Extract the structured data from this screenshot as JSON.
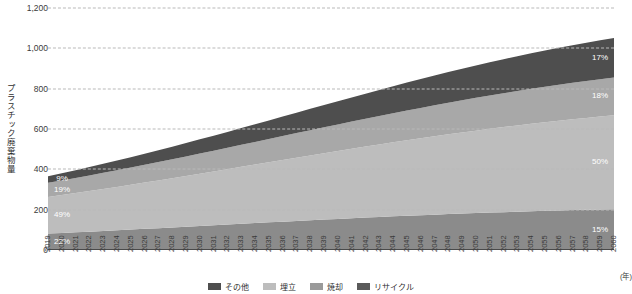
{
  "chart_data": {
    "type": "area",
    "stacked": true,
    "title": "",
    "xlabel": "(年)",
    "ylabel": "プラスチック廃棄物量",
    "ylim": [
      0,
      1200
    ],
    "yticks": [
      0,
      200,
      400,
      600,
      800,
      1000,
      1200
    ],
    "ytick_labels": [
      "0",
      "200",
      "400",
      "600",
      "800",
      "1,000",
      "1,200"
    ],
    "grid": true,
    "legend_position": "bottom",
    "x": [
      2019,
      2020,
      2021,
      2022,
      2023,
      2024,
      2025,
      2026,
      2027,
      2028,
      2029,
      2030,
      2031,
      2032,
      2033,
      2034,
      2035,
      2036,
      2037,
      2038,
      2039,
      2040,
      2041,
      2042,
      2043,
      2044,
      2045,
      2046,
      2047,
      2048,
      2049,
      2050,
      2051,
      2052,
      2053,
      2054,
      2055,
      2056,
      2057,
      2058,
      2059,
      2060
    ],
    "categories": [
      "2019",
      "2020",
      "2021",
      "2022",
      "2023",
      "2024",
      "2025",
      "2026",
      "2027",
      "2028",
      "2029",
      "2030",
      "2031",
      "2032",
      "2033",
      "2034",
      "2035",
      "2036",
      "2037",
      "2038",
      "2039",
      "2040",
      "2041",
      "2042",
      "2043",
      "2044",
      "2045",
      "2046",
      "2047",
      "2048",
      "2049",
      "2050",
      "2051",
      "2052",
      "2053",
      "2054",
      "2055",
      "2056",
      "2057",
      "2058",
      "2059",
      "2060"
    ],
    "series": [
      {
        "name": "リサイクル",
        "color": "#8b8b8b",
        "stack_order": 0,
        "values": [
          81.4,
          84.6,
          87.8,
          91.1,
          94.5,
          97.9,
          101.4,
          104.9,
          108.4,
          112.0,
          115.6,
          119.2,
          122.8,
          126.4,
          130.0,
          133.6,
          137.2,
          140.7,
          144.2,
          147.6,
          151.0,
          154.3,
          157.5,
          160.7,
          163.8,
          166.8,
          169.7,
          172.6,
          175.4,
          178.0,
          180.6,
          183.1,
          185.5,
          187.8,
          190.0,
          192.1,
          194.1,
          196.0,
          197.8,
          199.5,
          201.1,
          202.6
        ]
      },
      {
        "name": "焼却",
        "color": "#bdbdbd",
        "stack_order": 1,
        "values": [
          181.3,
          187.8,
          194.4,
          201.1,
          208.0,
          215.0,
          222.1,
          229.3,
          236.6,
          244.0,
          251.5,
          259.1,
          266.7,
          274.4,
          282.2,
          290.0,
          297.8,
          305.6,
          313.4,
          321.2,
          329.0,
          336.7,
          344.4,
          352.0,
          359.5,
          366.9,
          374.2,
          381.4,
          388.5,
          395.4,
          402.2,
          408.8,
          415.3,
          421.6,
          427.7,
          433.7,
          439.4,
          445.0,
          450.4,
          455.6,
          460.6,
          465.4
        ]
      },
      {
        "name": "埋立",
        "color": "#a8a8a8",
        "stack_order": 2,
        "values": [
          70.3,
          72.7,
          75.2,
          77.7,
          80.3,
          83.0,
          85.7,
          88.5,
          91.3,
          94.2,
          97.1,
          100.1,
          103.1,
          106.2,
          109.3,
          112.4,
          115.6,
          118.8,
          122.0,
          125.2,
          128.4,
          131.6,
          134.8,
          138.0,
          141.2,
          144.4,
          147.5,
          150.6,
          153.7,
          156.7,
          159.7,
          162.6,
          165.4,
          168.2,
          170.9,
          173.5,
          176.1,
          178.5,
          180.9,
          183.2,
          185.4,
          187.5
        ]
      },
      {
        "name": "その他",
        "color": "#4e4e4e",
        "stack_order": 3,
        "values": [
          33.3,
          35.9,
          38.6,
          41.5,
          44.6,
          47.8,
          51.2,
          54.7,
          58.4,
          62.2,
          66.1,
          70.2,
          74.3,
          78.6,
          83.0,
          87.4,
          91.9,
          96.5,
          101.1,
          105.8,
          110.5,
          115.2,
          119.9,
          124.6,
          129.3,
          134.0,
          138.6,
          143.2,
          147.7,
          152.1,
          156.4,
          160.6,
          164.7,
          168.7,
          172.6,
          176.3,
          179.9,
          183.4,
          186.8,
          190.0,
          193.1,
          196.0
        ]
      }
    ],
    "totals_note": "Stacked total rises from ~366 in 2019 to ~1,010 in 2060",
    "annotations": [
      {
        "text": "9%",
        "year": 2019,
        "series": "その他",
        "side": "left"
      },
      {
        "text": "19%",
        "year": 2019,
        "series": "埋立",
        "side": "left"
      },
      {
        "text": "49%",
        "year": 2019,
        "series": "焼却",
        "side": "left"
      },
      {
        "text": "22%",
        "year": 2019,
        "series": "リサイクル",
        "side": "left"
      },
      {
        "text": "17%",
        "year": 2060,
        "series": "その他",
        "side": "right"
      },
      {
        "text": "18%",
        "year": 2060,
        "series": "埋立",
        "side": "right"
      },
      {
        "text": "50%",
        "year": 2060,
        "series": "焼却",
        "side": "right"
      },
      {
        "text": "15%",
        "year": 2060,
        "series": "リサイクル",
        "side": "right"
      }
    ]
  },
  "legend": {
    "items": [
      {
        "label": "その他",
        "color": "#4e4e4e"
      },
      {
        "label": "埋立",
        "color": "#bdbdbd"
      },
      {
        "label": "焼却",
        "color": "#9a9a9a"
      },
      {
        "label": "リサイクル",
        "color": "#5a5a5a"
      }
    ]
  },
  "colors": {
    "grid": "#b9b9b9",
    "axis": "#4a4a4a",
    "text": "#3a3a3a",
    "annotation_text": "#ffffff",
    "background": "#ffffff"
  }
}
